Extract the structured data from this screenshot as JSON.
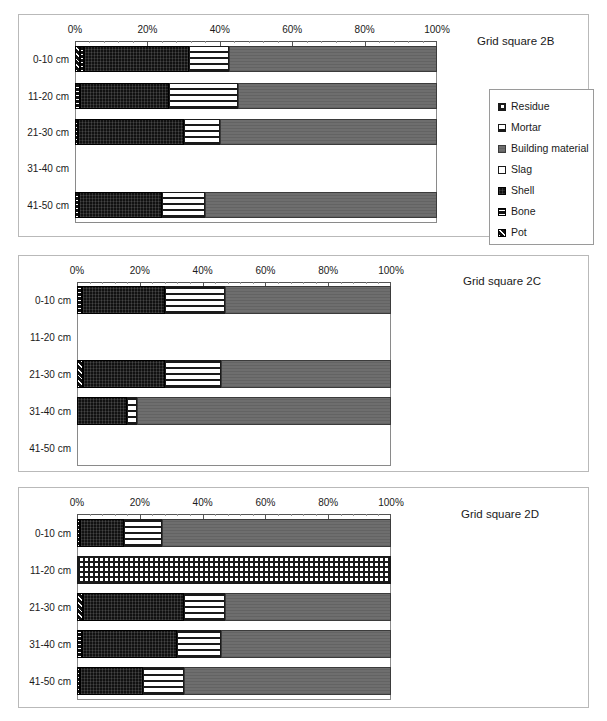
{
  "figure": {
    "caption_free": true
  },
  "legend": {
    "position": "right-of-plot-2B",
    "items": [
      {
        "label": "Residue",
        "pattern": "crosshatch-grid",
        "color": "#1a1a1a"
      },
      {
        "label": "Mortar",
        "pattern": "horizontal-stripe",
        "color": "#1a1a1a"
      },
      {
        "label": "Building material",
        "pattern": "solid-grey",
        "color": "#6e6e6e"
      },
      {
        "label": "Slag",
        "pattern": "solid-white",
        "color": "#ffffff"
      },
      {
        "label": "Shell",
        "pattern": "solid-black",
        "color": "#111111"
      },
      {
        "label": "Bone",
        "pattern": "fine-horizontal",
        "color": "#111111"
      },
      {
        "label": "Pot",
        "pattern": "diagonal-hatch",
        "color": "#111111"
      }
    ]
  },
  "charts": [
    {
      "id": "2B",
      "title": "Grid square 2B",
      "xticks": [
        "0%",
        "20%",
        "40%",
        "60%",
        "80%",
        "100%"
      ],
      "categories": [
        "0-10 cm",
        "11-20 cm",
        "21-30 cm",
        "31-40 cm",
        "41-50 cm"
      ]
    },
    {
      "id": "2C",
      "title": "Grid square 2C",
      "xticks": [
        "0%",
        "20%",
        "40%",
        "60%",
        "80%",
        "100%"
      ],
      "categories": [
        "0-10 cm",
        "11-20 cm",
        "21-30 cm",
        "31-40 cm",
        "41-50 cm"
      ]
    },
    {
      "id": "2D",
      "title": "Grid square 2D",
      "xticks": [
        "0%",
        "20%",
        "40%",
        "60%",
        "80%",
        "100%"
      ],
      "categories": [
        "0-10 cm",
        "11-20 cm",
        "21-30 cm",
        "31-40 cm",
        "41-50 cm"
      ]
    }
  ],
  "chart_data": [
    {
      "type": "bar",
      "orientation": "horizontal",
      "stacked": true,
      "stacked_percent": true,
      "title": "Grid square 2B",
      "xlabel": "",
      "ylabel": "",
      "xlim": [
        0,
        100
      ],
      "xticks": [
        0,
        20,
        40,
        60,
        80,
        100
      ],
      "xticklabels": [
        "0%",
        "20%",
        "40%",
        "60%",
        "80%",
        "100%"
      ],
      "grid": false,
      "legend": "right",
      "categories": [
        "0-10 cm",
        "11-20 cm",
        "21-30 cm",
        "31-40 cm",
        "41-50 cm"
      ],
      "series": [
        {
          "name": "Pot",
          "values": [
            1.5,
            0.0,
            0.0,
            0.0,
            0.0
          ]
        },
        {
          "name": "Bone",
          "values": [
            1.0,
            1.5,
            0.8,
            0.0,
            1.2
          ]
        },
        {
          "name": "Shell",
          "values": [
            29.0,
            24.5,
            29.2,
            0.0,
            22.8
          ]
        },
        {
          "name": "Mortar",
          "values": [
            11.0,
            19.0,
            10.0,
            0.0,
            12.0
          ]
        },
        {
          "name": "Building material",
          "values": [
            57.5,
            55.0,
            60.0,
            0.0,
            64.0
          ]
        }
      ]
    },
    {
      "type": "bar",
      "orientation": "horizontal",
      "stacked": true,
      "stacked_percent": true,
      "title": "Grid square 2C",
      "xlabel": "",
      "ylabel": "",
      "xlim": [
        0,
        100
      ],
      "xticks": [
        0,
        20,
        40,
        60,
        80,
        100
      ],
      "xticklabels": [
        "0%",
        "20%",
        "40%",
        "60%",
        "80%",
        "100%"
      ],
      "grid": false,
      "legend": "none",
      "categories": [
        "0-10 cm",
        "11-20 cm",
        "21-30 cm",
        "31-40 cm",
        "41-50 cm"
      ],
      "series": [
        {
          "name": "Pot",
          "values": [
            0.0,
            0.0,
            2.0,
            0.0,
            0.0
          ]
        },
        {
          "name": "Bone",
          "values": [
            1.5,
            0.0,
            0.0,
            0.0,
            0.0
          ]
        },
        {
          "name": "Shell",
          "values": [
            26.5,
            0.0,
            26.0,
            16.0,
            0.0
          ]
        },
        {
          "name": "Mortar",
          "values": [
            19.0,
            0.0,
            18.0,
            3.0,
            0.0
          ]
        },
        {
          "name": "Building material",
          "values": [
            53.0,
            0.0,
            54.0,
            81.0,
            0.0
          ]
        }
      ]
    },
    {
      "type": "bar",
      "orientation": "horizontal",
      "stacked": true,
      "stacked_percent": true,
      "title": "Grid square 2D",
      "xlabel": "",
      "ylabel": "",
      "xlim": [
        0,
        100
      ],
      "xticks": [
        0,
        20,
        40,
        60,
        80,
        100
      ],
      "xticklabels": [
        "0%",
        "20%",
        "40%",
        "60%",
        "80%",
        "100%"
      ],
      "grid": false,
      "legend": "none",
      "categories": [
        "0-10 cm",
        "11-20 cm",
        "21-30 cm",
        "31-40 cm",
        "41-50 cm"
      ],
      "series": [
        {
          "name": "Residue",
          "values": [
            0.0,
            100.0,
            0.0,
            0.0,
            0.0
          ]
        },
        {
          "name": "Pot",
          "values": [
            0.0,
            0.0,
            2.0,
            0.0,
            0.0
          ]
        },
        {
          "name": "Bone",
          "values": [
            1.0,
            0.0,
            0.0,
            1.5,
            1.0
          ]
        },
        {
          "name": "Shell",
          "values": [
            14.0,
            0.0,
            32.0,
            30.5,
            20.0
          ]
        },
        {
          "name": "Mortar",
          "values": [
            12.0,
            0.0,
            13.0,
            14.0,
            13.0
          ]
        },
        {
          "name": "Building material",
          "values": [
            73.0,
            0.0,
            53.0,
            54.0,
            66.0
          ]
        }
      ]
    }
  ]
}
